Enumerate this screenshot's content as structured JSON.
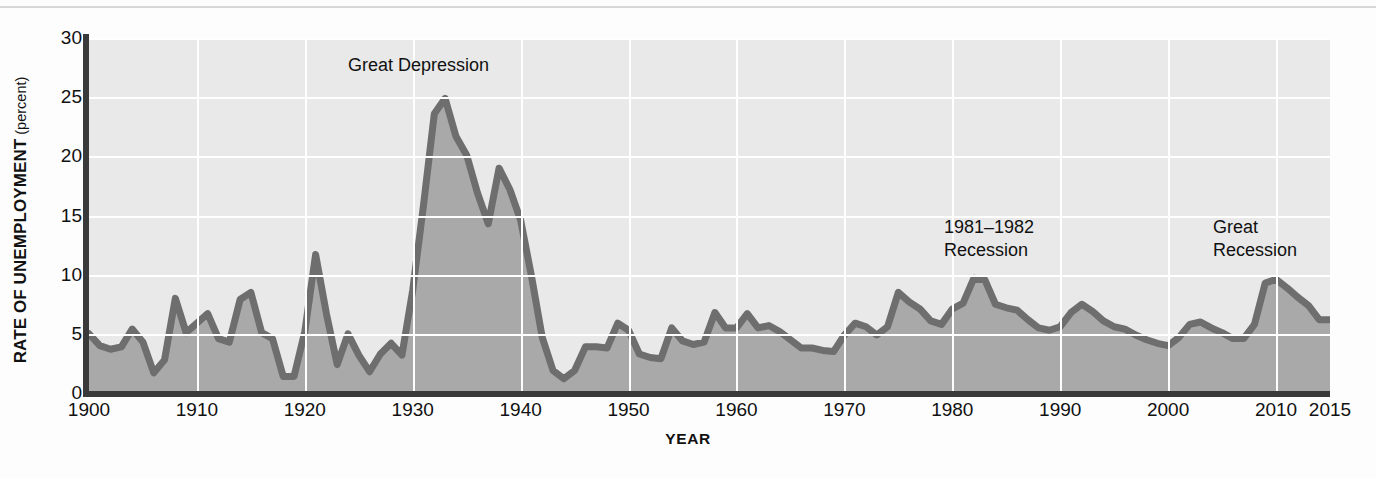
{
  "figure": {
    "background_color": "#fdfdfd",
    "plot_background_color": "#e9e9e9",
    "grid_color": "#ffffff",
    "axis_color": "#3a3a3a",
    "area_fill_color": "#a9a9a9",
    "line_color": "#6e6e6e"
  },
  "axes": {
    "ylabel_main": "RATE OF UNEMPLOYMENT",
    "ylabel_sub": " (percent)",
    "xlabel": "YEAR",
    "yticks": [
      0,
      5,
      10,
      15,
      20,
      25,
      30
    ],
    "ytick_labels": [
      "0",
      "5",
      "10",
      "15",
      "20",
      "25",
      "30"
    ],
    "xticks": [
      1900,
      1910,
      1920,
      1930,
      1940,
      1950,
      1960,
      1970,
      1980,
      1990,
      2000,
      2010,
      2015
    ],
    "xtick_labels": [
      "1900",
      "1910",
      "1920",
      "1930",
      "1940",
      "1950",
      "1960",
      "1970",
      "1980",
      "1990",
      "2000",
      "2010",
      "2015"
    ]
  },
  "annotations": [
    {
      "id": "great-depression",
      "text": "Great Depression"
    },
    {
      "id": "recession-1981-1982",
      "text": "1981–1982\nRecession"
    },
    {
      "id": "great-recession",
      "text": "Great\nRecession"
    }
  ],
  "chart_data": {
    "type": "area",
    "title": "",
    "subtitle": "",
    "xlabel": "YEAR",
    "ylabel": "RATE OF UNEMPLOYMENT (percent)",
    "xlim": [
      1900,
      2015
    ],
    "ylim": [
      0,
      30
    ],
    "grid": true,
    "legend": "none",
    "series_name": "Rate of unemployment",
    "units": "percent",
    "annotations": [
      "Great Depression",
      "1981–1982 Recession",
      "Great Recession"
    ],
    "x": [
      1900,
      1901,
      1902,
      1903,
      1904,
      1905,
      1906,
      1907,
      1908,
      1909,
      1910,
      1911,
      1912,
      1913,
      1914,
      1915,
      1916,
      1917,
      1918,
      1919,
      1920,
      1921,
      1922,
      1923,
      1924,
      1925,
      1926,
      1927,
      1928,
      1929,
      1930,
      1931,
      1932,
      1933,
      1934,
      1935,
      1936,
      1937,
      1938,
      1939,
      1940,
      1941,
      1942,
      1943,
      1944,
      1945,
      1946,
      1947,
      1948,
      1949,
      1950,
      1951,
      1952,
      1953,
      1954,
      1955,
      1956,
      1957,
      1958,
      1959,
      1960,
      1961,
      1962,
      1963,
      1964,
      1965,
      1966,
      1967,
      1968,
      1969,
      1970,
      1971,
      1972,
      1973,
      1974,
      1975,
      1976,
      1977,
      1978,
      1979,
      1980,
      1981,
      1982,
      1983,
      1984,
      1985,
      1986,
      1987,
      1988,
      1989,
      1990,
      1991,
      1992,
      1993,
      1994,
      1995,
      1996,
      1997,
      1998,
      1999,
      2000,
      2001,
      2002,
      2003,
      2004,
      2005,
      2006,
      2007,
      2008,
      2009,
      2010,
      2011,
      2012,
      2013,
      2014,
      2015
    ],
    "y": [
      5.0,
      4.0,
      3.7,
      3.9,
      5.4,
      4.3,
      1.7,
      2.8,
      8.0,
      5.1,
      5.9,
      6.7,
      4.6,
      4.3,
      7.9,
      8.5,
      5.1,
      4.6,
      1.4,
      1.4,
      5.2,
      11.7,
      6.7,
      2.4,
      5.0,
      3.2,
      1.8,
      3.3,
      4.2,
      3.2,
      8.7,
      15.9,
      23.6,
      24.9,
      21.7,
      20.1,
      16.9,
      14.3,
      19.0,
      17.2,
      14.6,
      9.9,
      4.7,
      1.9,
      1.2,
      1.9,
      3.9,
      3.9,
      3.8,
      5.9,
      5.3,
      3.3,
      3.0,
      2.9,
      5.5,
      4.4,
      4.1,
      4.3,
      6.8,
      5.5,
      5.5,
      6.7,
      5.5,
      5.7,
      5.2,
      4.5,
      3.8,
      3.8,
      3.6,
      3.5,
      4.9,
      5.9,
      5.6,
      4.9,
      5.6,
      8.5,
      7.7,
      7.1,
      6.1,
      5.8,
      7.1,
      7.6,
      9.7,
      9.6,
      7.5,
      7.2,
      7.0,
      6.2,
      5.5,
      5.3,
      5.6,
      6.8,
      7.5,
      6.9,
      6.1,
      5.6,
      5.4,
      4.9,
      4.5,
      4.2,
      4.0,
      4.7,
      5.8,
      6.0,
      5.5,
      5.1,
      4.6,
      4.6,
      5.8,
      9.3,
      9.6,
      8.9,
      8.1,
      7.4,
      6.2,
      6.2
    ]
  }
}
